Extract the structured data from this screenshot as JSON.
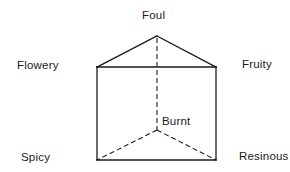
{
  "diagram": {
    "type": "odor-prism",
    "shape": "triangular prism",
    "labels": {
      "top": "Foul",
      "upper_left": "Flowery",
      "upper_right": "Fruity",
      "inner_back": "Burnt",
      "lower_left": "Spicy",
      "lower_right": "Resinous"
    },
    "vertices": {
      "foul": [
        157,
        36
      ],
      "flowery": [
        97,
        67
      ],
      "fruity": [
        216,
        67
      ],
      "burnt": [
        157,
        130
      ],
      "spicy": [
        97,
        160
      ],
      "resinous": [
        216,
        160
      ]
    },
    "edges": {
      "solid": [
        [
          "foul",
          "flowery"
        ],
        [
          "foul",
          "fruity"
        ],
        [
          "flowery",
          "fruity"
        ],
        [
          "flowery",
          "spicy"
        ],
        [
          "fruity",
          "resinous"
        ],
        [
          "spicy",
          "resinous"
        ]
      ],
      "dashed": [
        [
          "foul",
          "burnt"
        ],
        [
          "burnt",
          "spicy"
        ],
        [
          "burnt",
          "resinous"
        ]
      ]
    },
    "line_color": "#1a1a1a"
  }
}
